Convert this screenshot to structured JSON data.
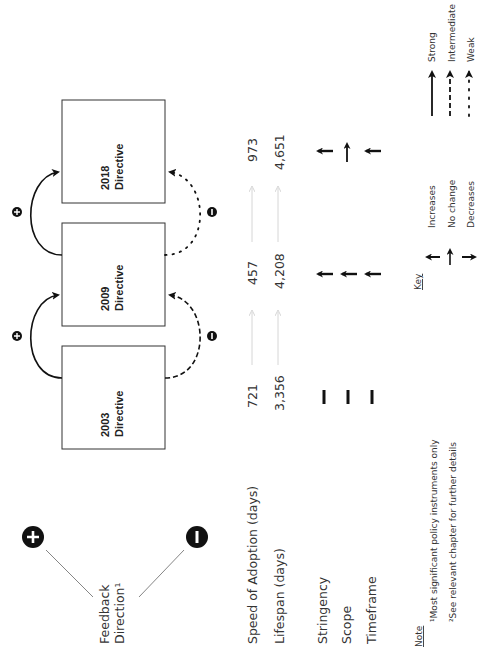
{
  "directives": [
    {
      "year": "2003",
      "label": "Directive"
    },
    {
      "year": "2009",
      "label": "Directive"
    },
    {
      "year": "2018",
      "label": "Directive"
    }
  ],
  "feedback": {
    "title_line1": "Feedback",
    "title_line2": "Direction¹",
    "positive_symbol": "+",
    "negative_symbol": "−"
  },
  "rows": {
    "speed_label": "Speed of Adoption (days)",
    "lifespan_label": "Lifespan (days)",
    "stringency_label": "Stringency",
    "scope_label": "Scope",
    "timeframe_label": "Timeframe"
  },
  "values": {
    "speed": [
      "721",
      "457",
      "973"
    ],
    "lifespan": [
      "3,356",
      "4,208",
      "4,651"
    ]
  },
  "changes": {
    "2003": [
      "baseline",
      "baseline",
      "baseline"
    ],
    "2009": [
      "increases",
      "increases",
      "increases"
    ],
    "2018": [
      "increases",
      "no change",
      "increases"
    ]
  },
  "links": [
    {
      "from": "2003",
      "to": "2009",
      "positive": "strong",
      "negative": "intermediate"
    },
    {
      "from": "2009",
      "to": "2018",
      "positive": "strong",
      "negative": "weak"
    }
  ],
  "key": {
    "title": "Key",
    "increases": "Increases",
    "no_change": "No change",
    "decreases": "Decreases",
    "strong": "Strong",
    "intermediate": "Intermediate",
    "weak": "Weak"
  },
  "note": {
    "title": "Note",
    "line1": "¹Most significant policy instruments only",
    "line2": "²See relevant chapter for further details"
  }
}
